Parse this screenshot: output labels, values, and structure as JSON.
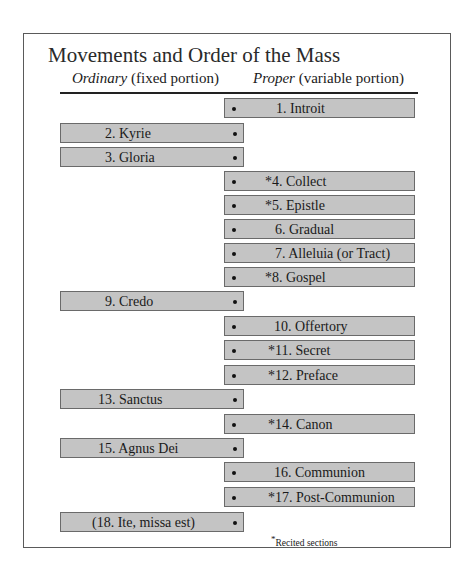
{
  "title": "Movements and Order of the Mass",
  "columns": {
    "ordinary": {
      "italic": "Ordinary",
      "rest": " (fixed portion)"
    },
    "proper": {
      "italic": "Proper",
      "rest": " (variable portion)"
    }
  },
  "colors": {
    "box_fill": "#c4c4c4",
    "box_border": "#6a6a6a",
    "frame": "#5a5a5a"
  },
  "movements": [
    {
      "n": 1,
      "label": "1.  Introit",
      "side": "proper",
      "recited": false
    },
    {
      "n": 2,
      "label": "2.  Kyrie",
      "side": "ordinary",
      "recited": false
    },
    {
      "n": 3,
      "label": "3.  Gloria",
      "side": "ordinary",
      "recited": false
    },
    {
      "n": 4,
      "label": "*4.  Collect",
      "side": "proper",
      "recited": true
    },
    {
      "n": 5,
      "label": "*5.  Epistle",
      "side": "proper",
      "recited": true
    },
    {
      "n": 6,
      "label": "6.  Gradual",
      "side": "proper",
      "recited": false
    },
    {
      "n": 7,
      "label": "7.  Alleluia (or Tract)",
      "side": "proper",
      "recited": false
    },
    {
      "n": 8,
      "label": "*8.  Gospel",
      "side": "proper",
      "recited": true
    },
    {
      "n": 9,
      "label": "9.  Credo",
      "side": "ordinary",
      "recited": false
    },
    {
      "n": 10,
      "label": "10.  Offertory",
      "side": "proper",
      "recited": false
    },
    {
      "n": 11,
      "label": "*11.  Secret",
      "side": "proper",
      "recited": true
    },
    {
      "n": 12,
      "label": "*12.  Preface",
      "side": "proper",
      "recited": true
    },
    {
      "n": 13,
      "label": "13.  Sanctus",
      "side": "ordinary",
      "recited": false
    },
    {
      "n": 14,
      "label": "*14.  Canon",
      "side": "proper",
      "recited": true
    },
    {
      "n": 15,
      "label": "15.  Agnus Dei",
      "side": "ordinary",
      "recited": false
    },
    {
      "n": 16,
      "label": "16.  Communion",
      "side": "proper",
      "recited": false
    },
    {
      "n": 17,
      "label": "*17.  Post-Communion",
      "side": "proper",
      "recited": true
    },
    {
      "n": 18,
      "label": "(18.  Ite, missa est)",
      "side": "ordinary",
      "recited": false
    }
  ],
  "footnote": {
    "mark": "*",
    "text": "Recited sections"
  }
}
